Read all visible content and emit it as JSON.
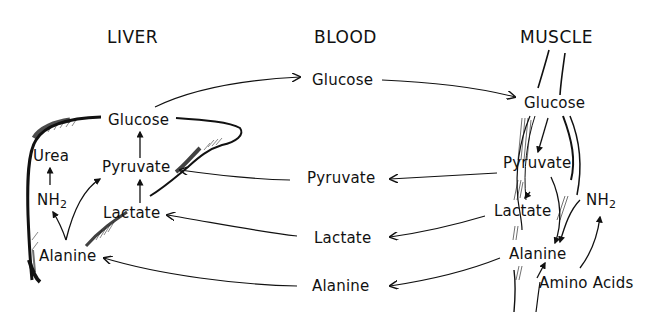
{
  "diagram": {
    "type": "metabolic-pathway",
    "columns": {
      "liver": "LIVER",
      "blood": "BLOOD",
      "muscle": "MUSCLE"
    },
    "liver": {
      "glucose": "Glucose",
      "pyruvate": "Pyruvate",
      "lactate": "Lactate",
      "alanine": "Alanine",
      "urea": "Urea",
      "nh2": "NH",
      "nh2_sub": "2"
    },
    "blood": {
      "glucose": "Glucose",
      "pyruvate": "Pyruvate",
      "lactate": "Lactate",
      "alanine": "Alanine"
    },
    "muscle": {
      "glucose": "Glucose",
      "pyruvate": "Pyruvate",
      "lactate": "Lactate",
      "alanine": "Alanine",
      "nh2": "NH",
      "nh2_sub": "2",
      "amino_acids": "Amino Acids"
    },
    "flows": [
      {
        "from": "liver.glucose",
        "to": "blood.glucose"
      },
      {
        "from": "blood.glucose",
        "to": "muscle.glucose"
      },
      {
        "from": "muscle.glucose",
        "to": "muscle.pyruvate"
      },
      {
        "from": "muscle.pyruvate",
        "to": "muscle.lactate"
      },
      {
        "from": "muscle.pyruvate",
        "to": "muscle.alanine"
      },
      {
        "from": "muscle.amino_acids",
        "to": "muscle.nh2"
      },
      {
        "from": "muscle.nh2",
        "to": "muscle.alanine"
      },
      {
        "from": "muscle.pyruvate",
        "to": "blood.pyruvate"
      },
      {
        "from": "muscle.lactate",
        "to": "blood.lactate"
      },
      {
        "from": "muscle.alanine",
        "to": "blood.alanine"
      },
      {
        "from": "blood.pyruvate",
        "to": "liver.pyruvate"
      },
      {
        "from": "blood.lactate",
        "to": "liver.lactate"
      },
      {
        "from": "blood.alanine",
        "to": "liver.alanine"
      },
      {
        "from": "liver.lactate",
        "to": "liver.pyruvate"
      },
      {
        "from": "liver.pyruvate",
        "to": "liver.glucose"
      },
      {
        "from": "liver.alanine",
        "to": "liver.pyruvate"
      },
      {
        "from": "liver.alanine",
        "to": "liver.nh2"
      },
      {
        "from": "liver.nh2",
        "to": "liver.urea"
      }
    ]
  }
}
